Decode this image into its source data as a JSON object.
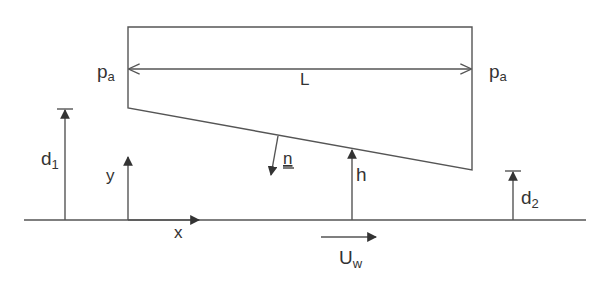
{
  "diagram": {
    "type": "slider-bearing-schematic",
    "labels": {
      "pressure_left": {
        "main": "p",
        "sub": "a"
      },
      "pressure_right": {
        "main": "p",
        "sub": "a"
      },
      "length": "L",
      "inlet_height": {
        "main": "d",
        "sub": "1"
      },
      "outlet_height": {
        "main": "d",
        "sub": "2"
      },
      "y_axis": "y",
      "x_axis": "x",
      "normal": "n",
      "gap_height": "h",
      "wall_velocity": {
        "main": "U",
        "sub": "w"
      }
    },
    "colors": {
      "line": "#555555",
      "text": "#333333",
      "background": "#ffffff"
    }
  }
}
